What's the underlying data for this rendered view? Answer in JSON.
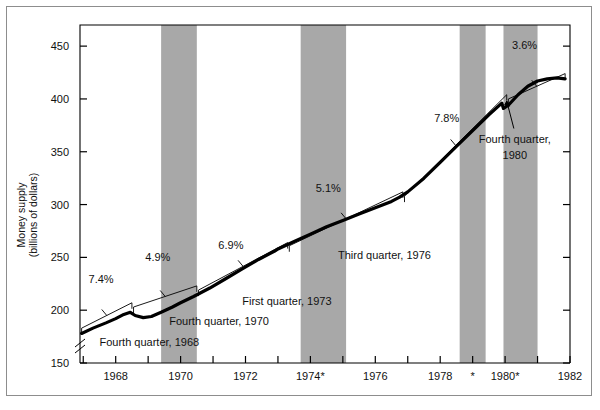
{
  "chart_data": {
    "type": "line",
    "title": "",
    "xlabel": "",
    "ylabel": "Money supply\n(billions of dollars)",
    "ylabel_line1": "Money supply",
    "ylabel_line2": "(billions of dollars)",
    "xlim": [
      1966.9,
      1982.0
    ],
    "ylim": [
      150,
      470
    ],
    "yticks": [
      150,
      200,
      250,
      300,
      350,
      400,
      450
    ],
    "ytick_labels": [
      "150",
      "200",
      "250",
      "300",
      "350",
      "400",
      "450"
    ],
    "xticks": [
      1967,
      1968,
      1969,
      1970,
      1971,
      1972,
      1973,
      1974,
      1975,
      1976,
      1977,
      1978,
      1979,
      1980,
      1981,
      1982
    ],
    "xtick_labels": [
      "1968",
      "1970",
      "1972",
      "1974*",
      "1976",
      "1978",
      "*",
      "1980*",
      "1982"
    ],
    "xtick_label_values": [
      1968,
      1970,
      1972,
      1974,
      1976,
      1978,
      1979,
      1980,
      1982
    ],
    "axis_break": true,
    "grid": false,
    "legend": "none",
    "series": [
      {
        "name": "Actual money supply",
        "style": "thick-black-curve",
        "points": [
          [
            1966.95,
            178
          ],
          [
            1967.3,
            183
          ],
          [
            1967.7,
            188
          ],
          [
            1968.0,
            192
          ],
          [
            1968.25,
            196
          ],
          [
            1968.45,
            198
          ],
          [
            1968.6,
            195
          ],
          [
            1968.85,
            193
          ],
          [
            1969.1,
            194
          ],
          [
            1969.4,
            198
          ],
          [
            1969.75,
            203
          ],
          [
            1970.0,
            207
          ],
          [
            1970.4,
            213
          ],
          [
            1970.9,
            221
          ],
          [
            1971.4,
            230
          ],
          [
            1971.9,
            239
          ],
          [
            1972.4,
            248
          ],
          [
            1972.9,
            256
          ],
          [
            1973.0,
            258
          ],
          [
            1973.5,
            265
          ],
          [
            1974.0,
            272
          ],
          [
            1974.5,
            279
          ],
          [
            1975.0,
            285
          ],
          [
            1975.5,
            291
          ],
          [
            1976.0,
            297
          ],
          [
            1976.5,
            303
          ],
          [
            1976.75,
            307
          ],
          [
            1977.0,
            312
          ],
          [
            1977.5,
            325
          ],
          [
            1978.0,
            340
          ],
          [
            1978.5,
            355
          ],
          [
            1979.0,
            370
          ],
          [
            1979.5,
            385
          ],
          [
            1979.9,
            396
          ],
          [
            1979.95,
            391
          ],
          [
            1980.1,
            394
          ],
          [
            1980.4,
            404
          ],
          [
            1980.7,
            412
          ],
          [
            1981.0,
            417
          ],
          [
            1981.3,
            419
          ],
          [
            1981.6,
            420
          ],
          [
            1981.85,
            419
          ]
        ]
      },
      {
        "name": "Target growth trend",
        "style": "thin-black-line",
        "segments": [
          {
            "rate": "7.4%",
            "from": [
              1966.95,
              183
            ],
            "to": [
              1968.5,
              207
            ]
          },
          {
            "rate": "4.9%",
            "from": [
              1968.55,
              203
            ],
            "to": [
              1970.5,
              223
            ]
          },
          {
            "rate": "6.9%",
            "from": [
              1970.55,
              219
            ],
            "to": [
              1973.3,
              264
            ]
          },
          {
            "rate": "5.1%",
            "from": [
              1973.35,
              261
            ],
            "to": [
              1976.85,
              312
            ]
          },
          {
            "rate": "7.8%",
            "from": [
              1976.9,
              308
            ],
            "to": [
              1980.05,
              404
            ]
          },
          {
            "rate": "3.6%",
            "from": [
              1980.1,
              400
            ],
            "to": [
              1981.85,
              424
            ]
          }
        ]
      }
    ],
    "growth_rate_annotations": [
      {
        "text": "7.4%",
        "x": 1967.55,
        "y": 226
      },
      {
        "text": "4.9%",
        "x": 1969.3,
        "y": 247
      },
      {
        "text": "6.9%",
        "x": 1971.55,
        "y": 258
      },
      {
        "text": "5.1%",
        "x": 1974.55,
        "y": 312
      },
      {
        "text": "7.8%",
        "x": 1978.2,
        "y": 378
      },
      {
        "text": "3.6%",
        "x": 1980.6,
        "y": 447
      }
    ],
    "point_annotations": [
      {
        "text": "Fourth quarter, 1968",
        "x": 1967.5,
        "y": 166,
        "anchor": "start"
      },
      {
        "text": "Fourth quarter, 1970",
        "x": 1969.65,
        "y": 186,
        "anchor": "start"
      },
      {
        "text": "First quarter, 1973",
        "x": 1971.9,
        "y": 205,
        "anchor": "start"
      },
      {
        "text": "Third quarter, 1976",
        "x": 1974.85,
        "y": 248,
        "anchor": "start"
      },
      {
        "text": "Fourth quarter,",
        "x": 1980.3,
        "y": 358,
        "anchor": "middle"
      },
      {
        "text": "1980",
        "x": 1980.3,
        "y": 343,
        "anchor": "middle"
      }
    ],
    "recession_bands": [
      {
        "start": 1969.4,
        "end": 1970.5
      },
      {
        "start": 1973.7,
        "end": 1975.1
      },
      {
        "start": 1978.6,
        "end": 1979.4
      },
      {
        "start": 1979.95,
        "end": 1981.0
      }
    ],
    "band_color": "#a8a8a8",
    "line_color": "#000000",
    "background": "#ffffff"
  }
}
